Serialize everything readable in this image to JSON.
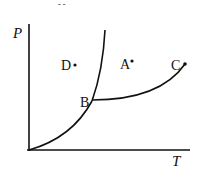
{
  "diagram": {
    "type": "phase-diagram",
    "axes": {
      "y_label": "P",
      "x_label": "T"
    },
    "points": [
      {
        "label": "A",
        "description": "point in region right of steep curve, above B–C curve"
      },
      {
        "label": "B",
        "description": "triple point where curves meet"
      },
      {
        "label": "C",
        "description": "endpoint of B–C curve (critical point)"
      },
      {
        "label": "D",
        "description": "point in region left of steep curve"
      }
    ],
    "curves": [
      {
        "name": "origin-to-B",
        "from": "origin",
        "to": "B"
      },
      {
        "name": "B-upward-steep",
        "from": "B",
        "to": "top"
      },
      {
        "name": "B-to-C",
        "from": "B",
        "to": "C"
      }
    ],
    "top_mark": "- -",
    "line_color": "#111111"
  }
}
